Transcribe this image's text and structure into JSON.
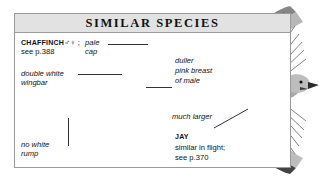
{
  "panel": {
    "title": "SIMILAR SPECIES",
    "border_color": "#9a9a9a",
    "title_band_color": "#e2e2e2",
    "background_color": "#ffffff"
  },
  "species": [
    {
      "id": "chaffinch",
      "name": "CHAFFINCH",
      "symbols": "♂♀ ;",
      "reference": "see p.388",
      "illustration": "perched-chaffinch-grayscale"
    },
    {
      "id": "jay",
      "name": "JAY",
      "note": "similar in flight;",
      "reference": "see p.370",
      "illustration": "jay-in-flight-grayscale"
    }
  ],
  "annotations": [
    {
      "id": "pale-cap",
      "line1": "pale",
      "line2": "cap"
    },
    {
      "id": "double-wingbar",
      "line1": "double white",
      "line2": "wingbar"
    },
    {
      "id": "no-white-rump",
      "line1": "no white",
      "line2": "rump"
    },
    {
      "id": "duller-breast",
      "line1": "duller",
      "line2": "pink breast",
      "line3": "of male"
    },
    {
      "id": "much-larger",
      "line1": "much larger"
    }
  ]
}
